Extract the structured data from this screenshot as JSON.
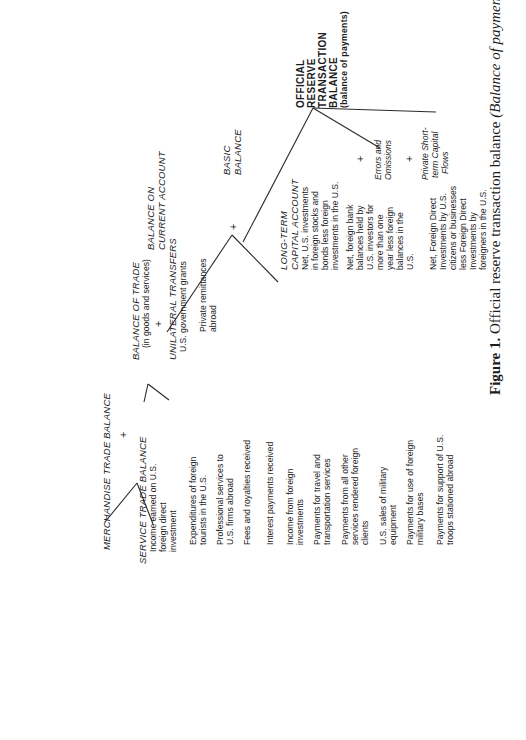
{
  "diagram": {
    "official_reserve": {
      "lines": [
        "OFFICIAL",
        "RESERVE",
        "TRANSACTION",
        "BALANCE"
      ],
      "subtitle": "(balance of payments)"
    },
    "basic_balance": {
      "lines": [
        "BASIC",
        "BALANCE"
      ]
    },
    "current_account": {
      "lines": [
        "BALANCE ON",
        "CURRENT ACCOUNT"
      ]
    },
    "balance_of_trade": {
      "title": "BALANCE OF TRADE",
      "subtitle": "(in goods and services)"
    },
    "unilateral_transfers": {
      "title": "UNILATERAL TRANSFERS",
      "items": [
        "U.S. government grants",
        "Private remittances",
        "abroad"
      ]
    },
    "merchandise_trade": {
      "title": "MERCHANDISE TRADE BALANCE"
    },
    "service_trade": {
      "title": "SERVICE TRADE BALANCE",
      "items": [
        {
          "lines": [
            "Income earned on U.S.",
            "foreign direct",
            "investment"
          ]
        },
        {
          "lines": [
            "Expenditures of foreign",
            "tourists in the U.S."
          ]
        },
        {
          "lines": [
            "Professional services to",
            "U.S. firms abroad"
          ]
        },
        {
          "lines": [
            "Fees and royalties received"
          ]
        },
        {
          "lines": [
            "Interest payments received"
          ]
        },
        {
          "lines": [
            "Income from foreign",
            "investments"
          ]
        },
        {
          "lines": [
            "Payments for travel and",
            "transportation services"
          ]
        },
        {
          "lines": [
            "Payments from all other",
            "services rendered foreign",
            "clients"
          ]
        },
        {
          "lines": [
            "U.S. sales of military",
            "equipment"
          ]
        },
        {
          "lines": [
            "Payments for use of foreign",
            "military bases"
          ]
        },
        {
          "lines": [
            "Payments for support of U.S.",
            "troops stationed abroad"
          ]
        }
      ]
    },
    "long_term_capital": {
      "title_lines": [
        "LONG-TERM",
        "CAPITAL ACCOUNT"
      ],
      "item1": [
        "Net, U.S. investments",
        "in foreign stocks and",
        "bonds less foreign",
        "investments in the U.S."
      ],
      "item2": [
        "Net, foreign bank",
        "balances held by",
        "U.S. investors for",
        "more than one",
        "year less foreign",
        "balances in the",
        "U.S."
      ],
      "item3": [
        "Net, Foreign Direct",
        "Investments by U.S.",
        "citizens or businesses",
        "less Foreign Direct",
        "Investments by",
        "foreigners in the U.S."
      ]
    },
    "errors_omissions": {
      "lines": [
        "Errors and",
        "Omissions"
      ]
    },
    "private_short_term": {
      "lines": [
        "Private Short-",
        "term Capital",
        "Flows"
      ]
    },
    "plus_sign": "+"
  },
  "caption": {
    "label": "Figure 1.",
    "text": " Official reserve transaction balance ",
    "italic": "(Balance of payments)"
  }
}
